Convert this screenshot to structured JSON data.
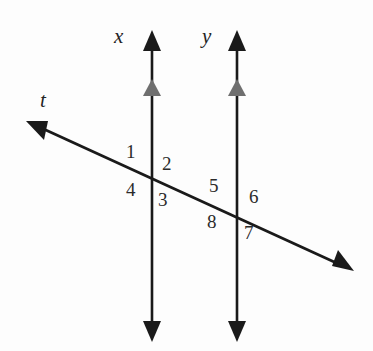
{
  "figure": {
    "canvas": {
      "width": 373,
      "height": 351,
      "background": "#fdfdfd"
    },
    "stroke_color": "#1a1a1a",
    "tick_color": "#6b6b6b",
    "line_labels": [
      {
        "id": "line-x",
        "text": "x",
        "x": 122,
        "y": 38
      },
      {
        "id": "line-y",
        "text": "y",
        "x": 210,
        "y": 38
      },
      {
        "id": "line-t",
        "text": "t",
        "x": 45,
        "y": 102
      }
    ],
    "angle_numbers": [
      {
        "text": "1",
        "x": 132,
        "y": 152
      },
      {
        "text": "2",
        "x": 168,
        "y": 164
      },
      {
        "text": "4",
        "x": 132,
        "y": 190
      },
      {
        "text": "3",
        "x": 164,
        "y": 200
      },
      {
        "text": "5",
        "x": 215,
        "y": 186
      },
      {
        "text": "6",
        "x": 255,
        "y": 197
      },
      {
        "text": "8",
        "x": 213,
        "y": 222
      },
      {
        "text": "7",
        "x": 250,
        "y": 233
      }
    ],
    "lines": {
      "x_line": {
        "name": "x",
        "x": 152,
        "y_top": 32,
        "y_bottom": 340
      },
      "y_line": {
        "name": "y",
        "x": 237,
        "y_top": 32,
        "y_bottom": 340
      },
      "transversal": {
        "name": "t",
        "x1": 28,
        "y1": 122,
        "x2": 352,
        "y2": 270
      }
    },
    "intersections": [
      {
        "label": "left-intersection",
        "x": 152,
        "y": 178
      },
      {
        "label": "right-intersection",
        "x": 237,
        "y": 209
      }
    ],
    "parallel_marks": [
      {
        "on": "x",
        "x": 152,
        "y": 90
      },
      {
        "on": "y",
        "x": 237,
        "y": 90
      }
    ]
  }
}
